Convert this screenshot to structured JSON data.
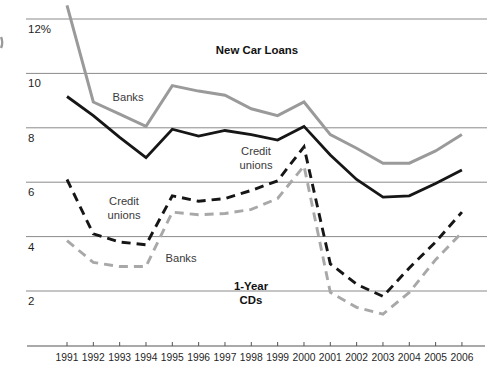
{
  "chart_data": {
    "type": "line",
    "title": "",
    "xlabel": "",
    "ylabel": "",
    "x": [
      1991,
      1992,
      1993,
      1994,
      1995,
      1996,
      1997,
      1998,
      1999,
      2000,
      2001,
      2002,
      2003,
      2004,
      2005,
      2006
    ],
    "ylim": [
      0.6,
      13.0
    ],
    "grid": "horizontal",
    "legend_position": "none (series labeled by in-plot annotations)",
    "y_ticks": [
      {
        "label": "12%",
        "value": 12
      },
      {
        "label": "10",
        "value": 10
      },
      {
        "label": "8",
        "value": 8
      },
      {
        "label": "6",
        "value": 6
      },
      {
        "label": "4",
        "value": 4
      },
      {
        "label": "2",
        "value": 2
      }
    ],
    "series": [
      {
        "name": "New Car Loans - Banks",
        "group": "New Car Loans",
        "institution": "Banks",
        "style": "solid",
        "color": "#9a9a9a",
        "width": 3,
        "values": [
          12.5,
          8.95,
          8.5,
          8.05,
          9.55,
          9.35,
          9.2,
          8.7,
          8.45,
          8.95,
          7.75,
          7.25,
          6.7,
          6.7,
          7.15,
          7.75
        ]
      },
      {
        "name": "New Car Loans - Credit unions",
        "group": "New Car Loans",
        "institution": "Credit unions",
        "style": "solid",
        "color": "#161616",
        "width": 2.8,
        "values": [
          9.15,
          8.45,
          7.65,
          6.9,
          7.95,
          7.7,
          7.9,
          7.75,
          7.55,
          8.05,
          7.0,
          6.1,
          5.45,
          5.5,
          5.95,
          6.45
        ]
      },
      {
        "name": "1-Year CDs - Credit unions",
        "group": "1-Year CDs",
        "institution": "Credit unions",
        "style": "dashed",
        "color": "#161616",
        "width": 2.9,
        "values": [
          6.1,
          4.1,
          3.8,
          3.7,
          5.5,
          5.3,
          5.4,
          5.7,
          6.05,
          7.3,
          3.0,
          2.25,
          1.8,
          2.85,
          3.8,
          4.9
        ]
      },
      {
        "name": "1-Year CDs - Banks",
        "group": "1-Year CDs",
        "institution": "Banks",
        "style": "dashed",
        "color": "#a8a8a8",
        "width": 2.9,
        "values": [
          3.85,
          3.05,
          2.9,
          2.9,
          4.9,
          4.8,
          4.85,
          5.0,
          5.4,
          6.6,
          1.95,
          1.4,
          1.15,
          1.95,
          3.15,
          4.15
        ]
      }
    ],
    "annotations": [
      {
        "id": "new-car-loans-title",
        "lines": [
          "New Car Loans"
        ],
        "bold": true,
        "x": 257,
        "y": 54
      },
      {
        "id": "banks-new-car-label",
        "lines": [
          "Banks"
        ],
        "bold": false,
        "x": 128,
        "y": 101
      },
      {
        "id": "credit-unions-new-car-label",
        "lines": [
          "Credit",
          "unions"
        ],
        "bold": false,
        "x": 256,
        "y": 155
      },
      {
        "id": "credit-unions-cd-label",
        "lines": [
          "Credit",
          "unions"
        ],
        "bold": false,
        "x": 124,
        "y": 205
      },
      {
        "id": "banks-cd-label",
        "lines": [
          "Banks"
        ],
        "bold": false,
        "x": 181,
        "y": 262
      },
      {
        "id": "one-year-cds-title",
        "lines": [
          "1-Year",
          "CDs"
        ],
        "bold": true,
        "x": 251,
        "y": 290
      }
    ]
  }
}
